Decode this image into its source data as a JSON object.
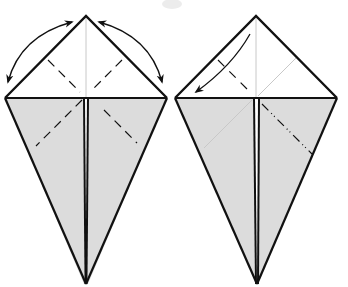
{
  "diagram": {
    "type": "origami-fold-instructions",
    "colors": {
      "background": "#ffffff",
      "paper_front": "#ffffff",
      "paper_back": "#dcdcdc",
      "line": "#111111",
      "crease_faint": "#c8c8c8",
      "smudge": "#ececec"
    },
    "steps": [
      {
        "name": "step-a",
        "description": "Kite base with upper triangle; valley-fold creases on both upper edges and both lower flaps; curved double-headed arrows on each side showing fold-and-unfold",
        "arrows": [
          "double-arrow-left",
          "double-arrow-right"
        ],
        "crease_lines": [
          "valley-upper-left",
          "valley-upper-right",
          "valley-lower-left",
          "valley-lower-right"
        ]
      },
      {
        "name": "step-b",
        "description": "Kite base; left upper edge folded down along crease (single curved arrow); mountain-fold line on lower right flap",
        "arrows": [
          "fold-arrow-left"
        ],
        "crease_lines": [
          "valley-upper-left",
          "mountain-lower-right",
          "faint-upper-right",
          "faint-lower-left"
        ]
      }
    ]
  }
}
